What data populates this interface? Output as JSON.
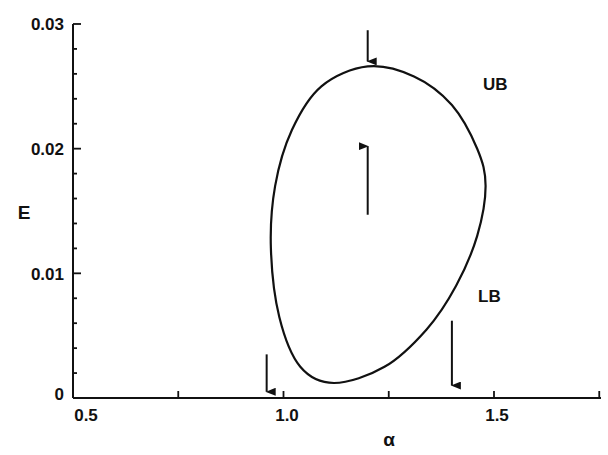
{
  "chart_data": {
    "type": "line",
    "title": "",
    "xlabel": "α",
    "ylabel": "E",
    "xlim": [
      0.5,
      1.75
    ],
    "ylim": [
      0,
      0.03
    ],
    "grid": false,
    "x_ticks": [
      {
        "value": 0.5,
        "label": "0.5"
      },
      {
        "value": 0.75,
        "label": ""
      },
      {
        "value": 1.0,
        "label": "1.0"
      },
      {
        "value": 1.25,
        "label": ""
      },
      {
        "value": 1.5,
        "label": "1.5"
      },
      {
        "value": 1.75,
        "label": ""
      }
    ],
    "y_ticks": [
      {
        "value": 0,
        "label": "0"
      },
      {
        "value": 0.002,
        "label": ""
      },
      {
        "value": 0.004,
        "label": ""
      },
      {
        "value": 0.006,
        "label": ""
      },
      {
        "value": 0.008,
        "label": ""
      },
      {
        "value": 0.01,
        "label": "0.01"
      },
      {
        "value": 0.012,
        "label": ""
      },
      {
        "value": 0.014,
        "label": ""
      },
      {
        "value": 0.016,
        "label": ""
      },
      {
        "value": 0.018,
        "label": ""
      },
      {
        "value": 0.02,
        "label": "0.02"
      },
      {
        "value": 0.022,
        "label": ""
      },
      {
        "value": 0.024,
        "label": ""
      },
      {
        "value": 0.026,
        "label": ""
      },
      {
        "value": 0.028,
        "label": ""
      },
      {
        "value": 0.03,
        "label": "0.03"
      }
    ],
    "series": [
      {
        "name": "closed boundary curve (UB upper / LB lower)",
        "closed": true,
        "points": [
          {
            "x": 1.2,
            "y": 0.0266
          },
          {
            "x": 1.31,
            "y": 0.0258
          },
          {
            "x": 1.4,
            "y": 0.0235
          },
          {
            "x": 1.46,
            "y": 0.02
          },
          {
            "x": 1.48,
            "y": 0.017
          },
          {
            "x": 1.46,
            "y": 0.013
          },
          {
            "x": 1.41,
            "y": 0.009
          },
          {
            "x": 1.34,
            "y": 0.0055
          },
          {
            "x": 1.24,
            "y": 0.0025
          },
          {
            "x": 1.12,
            "y": 0.0012
          },
          {
            "x": 1.04,
            "y": 0.0025
          },
          {
            "x": 0.99,
            "y": 0.0065
          },
          {
            "x": 0.97,
            "y": 0.012
          },
          {
            "x": 0.98,
            "y": 0.017
          },
          {
            "x": 1.02,
            "y": 0.0215
          },
          {
            "x": 1.09,
            "y": 0.025
          },
          {
            "x": 1.2,
            "y": 0.0266
          }
        ]
      }
    ],
    "annotations": [
      {
        "text": "UB",
        "x": 1.53,
        "y": 0.025
      },
      {
        "text": "LB",
        "x": 1.53,
        "y": 0.0085
      }
    ],
    "arrows": [
      {
        "direction": "down",
        "x": 1.2,
        "y_from": 0.0295,
        "y_to": 0.027
      },
      {
        "direction": "up",
        "x": 1.2,
        "y_from": 0.0147,
        "y_to": 0.0202
      },
      {
        "direction": "down",
        "x": 0.96,
        "y_from": 0.0035,
        "y_to": 0.0005
      },
      {
        "direction": "down",
        "x": 1.4,
        "y_from": 0.0062,
        "y_to": 0.001
      }
    ]
  },
  "labels": {
    "xlabel": "α",
    "ylabel": "E",
    "annot_ub": "UB",
    "annot_lb": "LB",
    "x_tick_05": "0.5",
    "x_tick_10": "1.0",
    "x_tick_15": "1.5",
    "y_tick_0": "0",
    "y_tick_001": "0.01",
    "y_tick_002": "0.02",
    "y_tick_003": "0.03"
  }
}
